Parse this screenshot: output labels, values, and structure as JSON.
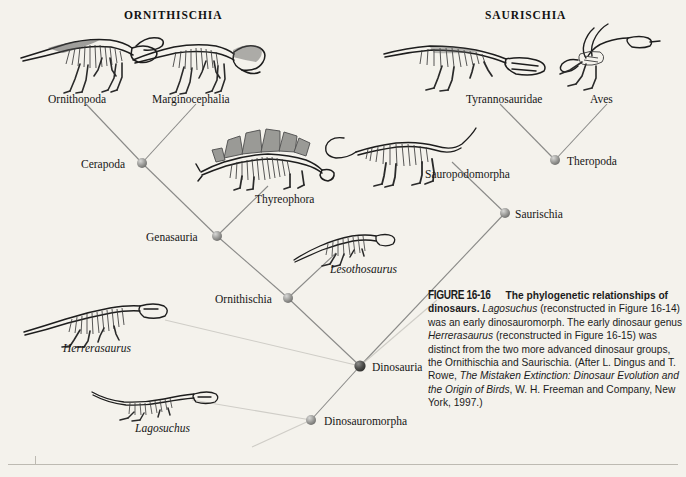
{
  "headers": {
    "left": "ORNITHISCHIA",
    "right": "SAURISCHIA"
  },
  "taxa": [
    {
      "label": "Ornithopoda",
      "x": 48,
      "y": 93,
      "italic": false
    },
    {
      "label": "Marginocephalia",
      "x": 152,
      "y": 93,
      "italic": false
    },
    {
      "label": "Cerapoda",
      "x": 81,
      "y": 158,
      "italic": false
    },
    {
      "label": "Thyreophora",
      "x": 255,
      "y": 193,
      "italic": false
    },
    {
      "label": "Genasauria",
      "x": 146,
      "y": 231,
      "italic": false
    },
    {
      "label": "Lesothosaurus",
      "x": 330,
      "y": 263,
      "italic": true
    },
    {
      "label": "Ornithischia",
      "x": 215,
      "y": 293,
      "italic": false
    },
    {
      "label": "Herrerasaurus",
      "x": 63,
      "y": 342,
      "italic": true
    },
    {
      "label": "Lagosuchus",
      "x": 135,
      "y": 422,
      "italic": true
    },
    {
      "label": "Dinosauria",
      "x": 372,
      "y": 361,
      "italic": false
    },
    {
      "label": "Dinosauromorpha",
      "x": 324,
      "y": 415,
      "italic": false
    },
    {
      "label": "Tyrannosauridae",
      "x": 466,
      "y": 93,
      "italic": false
    },
    {
      "label": "Aves",
      "x": 590,
      "y": 93,
      "italic": false
    },
    {
      "label": "Sauropodomorpha",
      "x": 425,
      "y": 168,
      "italic": false
    },
    {
      "label": "Theropoda",
      "x": 567,
      "y": 155,
      "italic": false
    },
    {
      "label": "Saurischia",
      "x": 515,
      "y": 208,
      "italic": false
    }
  ],
  "chart_data": {
    "type": "diagram",
    "title": "The phylogenetic relationships of dinosaurs",
    "diagram_kind": "cladogram",
    "root": "Dinosauromorpha",
    "nodes": [
      {
        "name": "Cerapoda",
        "x": 142,
        "y": 163,
        "kind": "internal"
      },
      {
        "name": "Genasauria",
        "x": 217,
        "y": 236,
        "kind": "internal"
      },
      {
        "name": "Ornithischia",
        "x": 288,
        "y": 298,
        "kind": "internal"
      },
      {
        "name": "Dinosauria",
        "x": 360,
        "y": 366,
        "kind": "internal"
      },
      {
        "name": "Dinosauromorpha",
        "x": 311,
        "y": 420,
        "kind": "internal"
      },
      {
        "name": "Saurischia",
        "x": 505,
        "y": 213,
        "kind": "internal"
      },
      {
        "name": "Theropoda",
        "x": 555,
        "y": 160,
        "kind": "internal"
      }
    ],
    "tips": [
      "Ornithopoda",
      "Marginocephalia",
      "Thyreophora",
      "Lesothosaurus",
      "Herrerasaurus",
      "Lagosuchus",
      "Tyrannosauridae",
      "Aves",
      "Sauropodomorpha"
    ],
    "edges": [
      {
        "from": "Cerapoda",
        "to": "Ornithopoda"
      },
      {
        "from": "Cerapoda",
        "to": "Marginocephalia"
      },
      {
        "from": "Genasauria",
        "to": "Cerapoda"
      },
      {
        "from": "Genasauria",
        "to": "Thyreophora"
      },
      {
        "from": "Ornithischia",
        "to": "Genasauria"
      },
      {
        "from": "Ornithischia",
        "to": "Lesothosaurus"
      },
      {
        "from": "Dinosauria",
        "to": "Ornithischia"
      },
      {
        "from": "Dinosauria",
        "to": "Saurischia"
      },
      {
        "from": "Dinosauria",
        "to": "Herrerasaurus"
      },
      {
        "from": "Dinosauromorpha",
        "to": "Dinosauria"
      },
      {
        "from": "Dinosauromorpha",
        "to": "Lagosuchus"
      },
      {
        "from": "Saurischia",
        "to": "Sauropodomorpha"
      },
      {
        "from": "Saurischia",
        "to": "Theropoda"
      },
      {
        "from": "Theropoda",
        "to": "Tyrannosauridae"
      },
      {
        "from": "Theropoda",
        "to": "Aves"
      }
    ],
    "clades": {
      "left": "ORNITHISCHIA",
      "right": "SAURISCHIA"
    }
  },
  "caption": {
    "figure_label": "FIGURE 16-16",
    "bold_lead": "The phylogenetic relationships of dinosaurs.",
    "genus1": "Lagosuchus",
    "text1": " (reconstructed in Figure 16-14) was an early dinosauromorph. The early dinosaur genus ",
    "genus2": "Herrerasaurus",
    "text2": " (reconstructed in Figure 16-15) was distinct from the two more advanced dinosaur groups, the Ornithischia and Saurischia. (After L. Dingus and T. Rowe, ",
    "source_title": "The Mistaken Extinction: Dinosaur Evolution and the Origin of Birds",
    "text3": ", W. H. Freeman and Company, New York, 1997.)"
  },
  "colors": {
    "background": "#f4f2ec",
    "node": "#8d8d8d",
    "node_root": "#4a4a4a",
    "branch": "#8a8a88",
    "branch_faint": "#cfcdc7",
    "bone_dark": "#1d1d1d",
    "bone_mid": "#6f6f6f",
    "plate": "#9a9a96",
    "text": "#1a1a1a"
  }
}
